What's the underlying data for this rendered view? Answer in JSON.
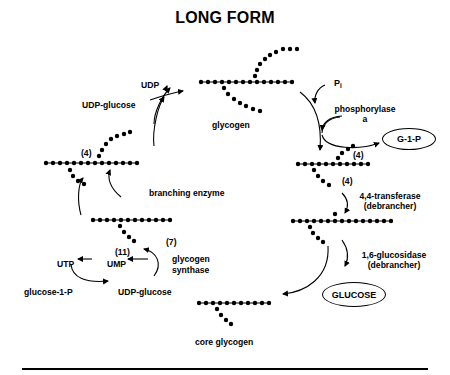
{
  "title": "LONG FORM",
  "labels": {
    "udp": "UDP",
    "udp_glucose_top": "UDP-glucose",
    "glycogen": "glycogen",
    "pi": "P",
    "pi_sub": "i",
    "phosphorylase_line1": "phosphorylase",
    "phosphorylase_line2": "a",
    "g1p": "G-1-P",
    "four_a": "(4)",
    "four_b": "(4)",
    "four_c": "(4)",
    "transferase_line1": "4,4-transferase",
    "transferase_line2": "(debrancher)",
    "branching_enzyme": "branching enzyme",
    "eleven": "(11)",
    "seven": "(7)",
    "glycogen_synthase_line1": "glycogen",
    "glycogen_synthase_line2": "synthase",
    "utp": "UTP",
    "ump": "UMP",
    "glucose_1_p": "glucose-1-P",
    "udp_glucose_bottom": "UDP-glucose",
    "glucosidase_line1": "1,6-glucosidase",
    "glucosidase_line2": "(debrancher)",
    "glucose": "GLUCOSE",
    "core_glycogen": "core glycogen"
  },
  "colors": {
    "ink": "#000000",
    "background": "#ffffff"
  }
}
